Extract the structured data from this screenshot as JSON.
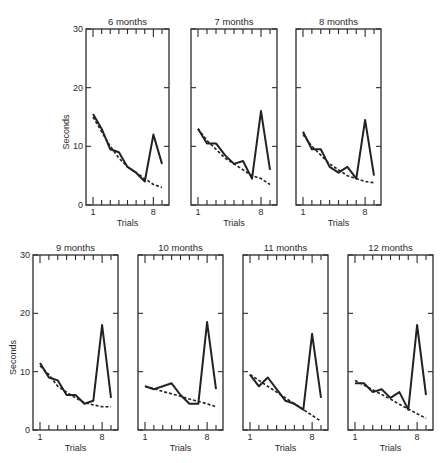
{
  "chart_data": {
    "type": "line",
    "title": "",
    "xlabel": "Trials",
    "ylabel": "Seconds",
    "ylim": [
      0,
      30
    ],
    "yticks": [
      0,
      10,
      20,
      30
    ],
    "x": [
      1,
      2,
      3,
      4,
      5,
      6,
      7,
      8,
      9
    ],
    "xtick_labels": [
      "1",
      "8"
    ],
    "legend": [],
    "grid": false,
    "line_styles": {
      "observed": "solid",
      "fitted": "dashed"
    },
    "panels": [
      {
        "title": "6 months",
        "series": [
          {
            "name": "observed",
            "values": [
              15.5,
              13,
              9.5,
              9,
              6.5,
              5.5,
              4,
              12,
              7
            ]
          },
          {
            "name": "fitted",
            "values": [
              15,
              12.5,
              10,
              8,
              6.5,
              5.5,
              4.5,
              3.5,
              3
            ]
          }
        ]
      },
      {
        "title": "7 months",
        "series": [
          {
            "name": "observed",
            "values": [
              13,
              10.5,
              10.5,
              8.5,
              7,
              7.5,
              4.5,
              16,
              6
            ]
          },
          {
            "name": "fitted",
            "values": [
              13,
              11,
              9.5,
              8,
              7,
              6,
              5,
              4.5,
              3.5
            ]
          }
        ]
      },
      {
        "title": "8 months",
        "series": [
          {
            "name": "observed",
            "values": [
              12.5,
              9.5,
              9.5,
              6.5,
              5.5,
              6.5,
              4.5,
              14.5,
              5
            ]
          },
          {
            "name": "fitted",
            "values": [
              12,
              10,
              8.5,
              7,
              6,
              5,
              4.5,
              4,
              3.8
            ]
          }
        ]
      },
      {
        "title": "9 months",
        "series": [
          {
            "name": "observed",
            "values": [
              11.5,
              9,
              8.5,
              6,
              6,
              4.5,
              5,
              18,
              5.5
            ]
          },
          {
            "name": "fitted",
            "values": [
              11,
              9.5,
              7.5,
              6.5,
              5.5,
              4.7,
              4.3,
              4,
              4
            ]
          }
        ]
      },
      {
        "title": "10 months",
        "series": [
          {
            "name": "observed",
            "values": [
              7.5,
              7,
              7.5,
              8,
              6,
              4.5,
              4.5,
              18.5,
              7
            ]
          },
          {
            "name": "fitted",
            "values": [
              7.5,
              7.1,
              6.6,
              6.2,
              5.8,
              5.3,
              4.9,
              4.5,
              4
            ]
          }
        ]
      },
      {
        "title": "11 months",
        "series": [
          {
            "name": "observed",
            "values": [
              9.5,
              7.5,
              9,
              7,
              5,
              4.5,
              3.5,
              16.5,
              5.5
            ]
          },
          {
            "name": "fitted",
            "values": [
              9.5,
              8.5,
              7.5,
              6.5,
              5.5,
              4.5,
              3.5,
              2.5,
              1.5
            ]
          }
        ]
      },
      {
        "title": "12 months",
        "series": [
          {
            "name": "observed",
            "values": [
              8,
              8,
              6.5,
              7,
              5.5,
              6.5,
              3.5,
              18,
              6
            ]
          },
          {
            "name": "fitted",
            "values": [
              8.5,
              7.7,
              6.9,
              6.1,
              5.3,
              4.4,
              3.6,
              2.8,
              2
            ]
          }
        ]
      }
    ]
  },
  "layout_text": {
    "xlabel": "Trials",
    "ylabel": "Seconds",
    "ytick_labels": [
      "0",
      "10",
      "20",
      "30"
    ]
  }
}
